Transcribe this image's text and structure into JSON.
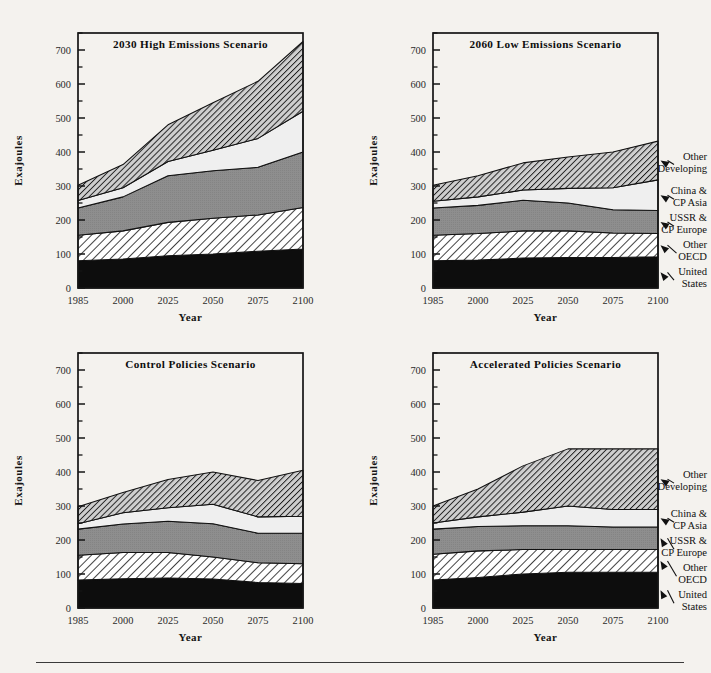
{
  "figure": {
    "axis_y_label": "Exajoules",
    "axis_x_label": "Year",
    "y_ticks": [
      0,
      100,
      200,
      300,
      400,
      500,
      600,
      700
    ],
    "y_minor_ticks": [
      50,
      150,
      250,
      350,
      450,
      550,
      650,
      750
    ],
    "y_range": [
      0,
      750
    ],
    "x_ticks": [
      "1985",
      "2000",
      "2025",
      "2050",
      "2075",
      "2100"
    ],
    "series_order": [
      "United States",
      "Other OECD",
      "USSR & CP Europe",
      "China & CP Asia",
      "Other Developing"
    ],
    "legend_labels": [
      {
        "line1": "Other",
        "line2": "Developing"
      },
      {
        "line1": "China &",
        "line2": "CP Asia"
      },
      {
        "line1": "USSR &",
        "line2": "CP Europe"
      },
      {
        "line1": "Other",
        "line2": "OECD"
      },
      {
        "line1": "United",
        "line2": "States"
      }
    ],
    "colors": {
      "united_states": "#0d0d0d",
      "other_oecd": "#ffffff",
      "ussr_cp_europe": "#8a8a8a",
      "china_cp_asia": "#efefef",
      "other_developing": "#b6b6b6",
      "outline": "#111111",
      "page_background": "#f4f2ee"
    }
  },
  "chart_data": [
    {
      "type": "area",
      "panel": "top-left",
      "title": "2030 High Emissions Scenario",
      "xlabel": "Year",
      "ylabel": "Exajoules",
      "ylim": [
        0,
        750
      ],
      "grid": false,
      "legend": "none",
      "x": [
        1985,
        2000,
        2025,
        2050,
        2075,
        2100
      ],
      "x_ticklabels": [
        "1985",
        "2000",
        "2025",
        "2050",
        "2075",
        "2100"
      ],
      "stacked": true,
      "series": [
        {
          "name": "United States",
          "values": [
            80,
            85,
            95,
            100,
            108,
            115
          ]
        },
        {
          "name": "Other OECD",
          "values": [
            155,
            168,
            193,
            205,
            215,
            237
          ]
        },
        {
          "name": "USSR & CP Europe",
          "values": [
            235,
            268,
            330,
            345,
            355,
            400
          ]
        },
        {
          "name": "China & CP Asia",
          "values": [
            257,
            295,
            372,
            405,
            440,
            520
          ]
        },
        {
          "name": "Other Developing",
          "values": [
            302,
            363,
            480,
            545,
            608,
            725
          ]
        }
      ],
      "note": "series values are cumulative stack tops in exajoules"
    },
    {
      "type": "area",
      "panel": "top-right",
      "title": "2060 Low Emissions Scenario",
      "xlabel": "Year",
      "ylabel": "Exajoules",
      "ylim": [
        0,
        750
      ],
      "grid": false,
      "legend": "right-leader-lines",
      "x": [
        1985,
        2000,
        2025,
        2050,
        2075,
        2100
      ],
      "x_ticklabels": [
        "1985",
        "2000",
        "2025",
        "2050",
        "2075",
        "2100"
      ],
      "stacked": true,
      "series": [
        {
          "name": "United States",
          "values": [
            80,
            82,
            88,
            90,
            90,
            92
          ]
        },
        {
          "name": "Other OECD",
          "values": [
            155,
            160,
            168,
            168,
            162,
            160
          ]
        },
        {
          "name": "USSR & CP Europe",
          "values": [
            235,
            243,
            258,
            250,
            230,
            228
          ]
        },
        {
          "name": "China & CP Asia",
          "values": [
            255,
            268,
            288,
            293,
            295,
            318
          ]
        },
        {
          "name": "Other Developing",
          "values": [
            302,
            330,
            368,
            385,
            400,
            432
          ]
        }
      ],
      "note": "series values are cumulative stack tops in exajoules"
    },
    {
      "type": "area",
      "panel": "bottom-left",
      "title": "Control Policies Scenario",
      "xlabel": "Year",
      "ylabel": "Exajoules",
      "ylim": [
        0,
        750
      ],
      "grid": false,
      "legend": "none",
      "x": [
        1985,
        2000,
        2025,
        2050,
        2075,
        2100
      ],
      "x_ticklabels": [
        "1985",
        "2000",
        "2025",
        "2050",
        "2075",
        "2100"
      ],
      "stacked": true,
      "series": [
        {
          "name": "United States",
          "values": [
            82,
            86,
            88,
            85,
            75,
            72
          ]
        },
        {
          "name": "Other OECD",
          "values": [
            155,
            163,
            163,
            150,
            133,
            130
          ]
        },
        {
          "name": "USSR & CP Europe",
          "values": [
            232,
            247,
            255,
            248,
            220,
            220
          ]
        },
        {
          "name": "China & CP Asia",
          "values": [
            248,
            280,
            295,
            305,
            268,
            270
          ]
        },
        {
          "name": "Other Developing",
          "values": [
            298,
            340,
            378,
            400,
            375,
            405
          ]
        }
      ],
      "note": "series values are cumulative stack tops in exajoules"
    },
    {
      "type": "area",
      "panel": "bottom-right",
      "title": "Accelerated Policies Scenario",
      "xlabel": "Year",
      "ylabel": "Exajoules",
      "ylim": [
        0,
        750
      ],
      "grid": false,
      "legend": "right-leader-lines",
      "x": [
        1985,
        2000,
        2025,
        2050,
        2075,
        2100
      ],
      "x_ticklabels": [
        "1985",
        "2000",
        "2025",
        "2050",
        "2075",
        "2100"
      ],
      "stacked": true,
      "series": [
        {
          "name": "United States",
          "values": [
            82,
            90,
            100,
            105,
            105,
            105
          ]
        },
        {
          "name": "Other OECD",
          "values": [
            158,
            168,
            172,
            172,
            172,
            172
          ]
        },
        {
          "name": "USSR & CP Europe",
          "values": [
            232,
            240,
            242,
            242,
            238,
            238
          ]
        },
        {
          "name": "China & CP Asia",
          "values": [
            250,
            268,
            282,
            300,
            290,
            290
          ]
        },
        {
          "name": "Other Developing",
          "values": [
            300,
            350,
            418,
            468,
            468,
            468
          ]
        }
      ],
      "note": "series values are cumulative stack tops in exajoules"
    }
  ]
}
